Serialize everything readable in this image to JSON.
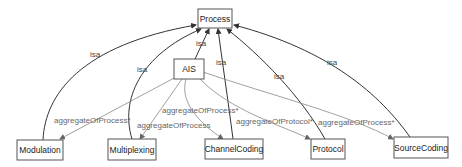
{
  "diagram": {
    "title": "",
    "nodes": {
      "process": {
        "label": "Process"
      },
      "ais": {
        "label": "AIS"
      },
      "modulation": {
        "label": "Modulation"
      },
      "multiplexing": {
        "label": "Multiplexing"
      },
      "channelcoding": {
        "label": "ChannelCoding"
      },
      "protocol": {
        "label": "Protocol"
      },
      "sourcecoding": {
        "label": "SourceCoding"
      }
    },
    "edges": {
      "ais_process": {
        "label": "isa",
        "from": "AIS",
        "to": "Process"
      },
      "modulation_process": {
        "label": "isa",
        "from": "Modulation",
        "to": "Process"
      },
      "multiplexing_process": {
        "label": "isa",
        "from": "Multiplexing",
        "to": "Process"
      },
      "channelcoding_process": {
        "label": "isa",
        "from": "ChannelCoding",
        "to": "Process"
      },
      "protocol_process": {
        "label": "isa",
        "from": "Protocol",
        "to": "Process"
      },
      "sourcecoding_process": {
        "label": "isa",
        "from": "SourceCoding",
        "to": "Process"
      },
      "ais_modulation": {
        "label": "aggregateOfProcess*",
        "from": "AIS",
        "to": "Modulation"
      },
      "ais_multiplexing": {
        "label": "aggregateOfProcess",
        "from": "AIS",
        "to": "Multiplexing"
      },
      "ais_channelcoding": {
        "label": "aggregateOfProcess*",
        "from": "AIS",
        "to": "ChannelCoding"
      },
      "ais_protocol": {
        "label": "aggregateOfProtocol*",
        "from": "AIS",
        "to": "Protocol"
      },
      "ais_sourcecoding": {
        "label": "aggregateOfProcess*",
        "from": "AIS",
        "to": "SourceCoding"
      }
    },
    "colors": {
      "node_border": "#555555",
      "isa_edge": "#333333",
      "aggregate_edge": "#888888",
      "background": "#ffffff"
    }
  }
}
